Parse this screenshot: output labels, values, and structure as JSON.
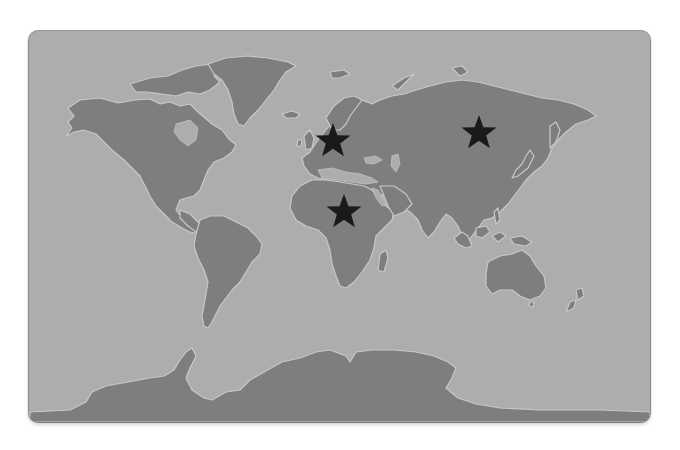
{
  "map": {
    "style": "grayscale world map",
    "colors": {
      "ocean": "#adadad",
      "land": "#7e7e7e",
      "coast_glow": "#c8c8c8",
      "marker": "#1a1a1a",
      "card_border": "#9a9a9a"
    },
    "markers": [
      {
        "id": "europe",
        "icon": "star-icon",
        "region": "Central Europe",
        "x": 333,
        "y": 141
      },
      {
        "id": "siberia",
        "icon": "star-icon",
        "region": "Central Siberia (Russia)",
        "x": 479,
        "y": 133
      },
      {
        "id": "central-africa",
        "icon": "star-icon",
        "region": "Central Africa",
        "x": 344,
        "y": 212
      }
    ]
  }
}
